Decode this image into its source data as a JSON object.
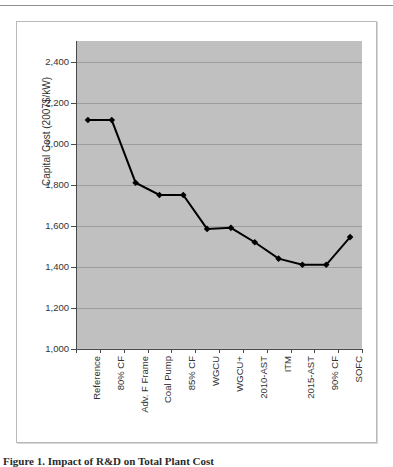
{
  "document": {
    "caption": "Figure 1. Impact of R&D on Total Plant Cost"
  },
  "chart_data": {
    "type": "line",
    "title": "",
    "xlabel": "",
    "ylabel": "Capital Cost (2007$/kW)",
    "categories": [
      "Reference",
      "80% CF",
      "Adv. F Frame",
      "Coal Pump",
      "85% CF",
      "WGCU",
      "WGCU+",
      "2010-AST",
      "ITM",
      "2015-AST",
      "90% CF",
      "SOFC"
    ],
    "values": [
      2115,
      2115,
      1810,
      1750,
      1750,
      1585,
      1590,
      1520,
      1440,
      1410,
      1410,
      1545
    ],
    "ylim": [
      1000,
      2500
    ],
    "ytick_values": [
      2400,
      2200,
      2000,
      1800,
      1600,
      1400,
      1200,
      1000
    ],
    "ytick_labels": [
      "2,400",
      "2,200",
      "2,000",
      "1,800",
      "1,600",
      "1,400",
      "1,200",
      "1,000"
    ],
    "grid": true,
    "legend": "none",
    "series_color": "#000000",
    "marker": "diamond",
    "plot_background": "#c3c3c3",
    "gridline_color": "#9d9d9d",
    "axis_color": "#4a4a4a"
  }
}
